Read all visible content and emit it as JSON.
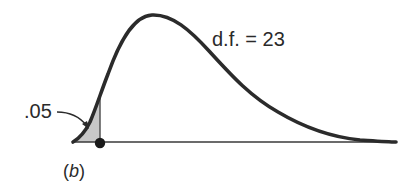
{
  "figure": {
    "distribution": "chi-square",
    "degrees_of_freedom_label": "d.f. = 23",
    "tail_area_label": ".05",
    "tail": "left",
    "panel_label": {
      "open": "(",
      "letter": "b",
      "close": ")"
    },
    "colors": {
      "curve": "#2b2b2b",
      "baseline": "#3a3a3a",
      "shade": "#c8c8c8",
      "critical_point": "#1a1a1a",
      "text": "#2a2a2a"
    }
  }
}
